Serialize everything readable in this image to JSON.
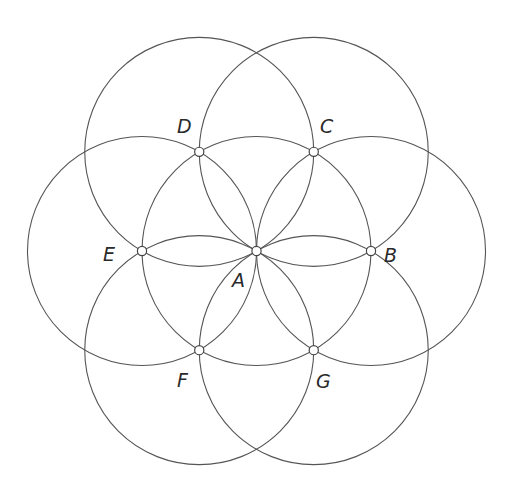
{
  "diagram": {
    "stroke_color": "#555555",
    "background": "#ffffff",
    "center_point": "A",
    "points": [
      {
        "id": "A",
        "label": "A",
        "angle_deg": null
      },
      {
        "id": "B",
        "label": "B",
        "angle_deg": 0
      },
      {
        "id": "C",
        "label": "C",
        "angle_deg": 60
      },
      {
        "id": "D",
        "label": "D",
        "angle_deg": 120
      },
      {
        "id": "E",
        "label": "E",
        "angle_deg": 180
      },
      {
        "id": "F",
        "label": "F",
        "angle_deg": 240
      },
      {
        "id": "G",
        "label": "G",
        "angle_deg": 300
      }
    ],
    "circles": [
      {
        "center": "A"
      },
      {
        "center": "B"
      },
      {
        "center": "C"
      },
      {
        "center": "D"
      },
      {
        "center": "E"
      },
      {
        "center": "F"
      },
      {
        "center": "G"
      }
    ]
  }
}
